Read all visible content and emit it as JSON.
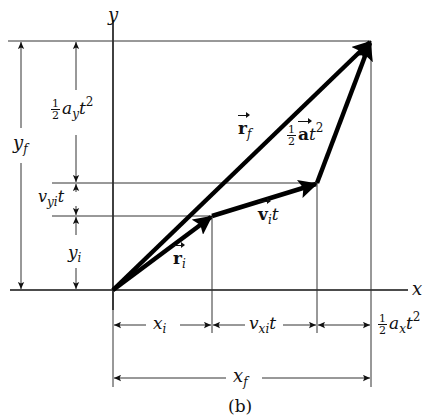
{
  "figure": {
    "caption": "(b)",
    "axes": {
      "x_label": "x",
      "y_label": "y"
    },
    "vectors": {
      "r_i": {
        "symbol": "r",
        "subscript": "i"
      },
      "v_i_t": {
        "symbol": "v",
        "subscript": "i",
        "suffix": "t"
      },
      "r_f": {
        "symbol": "r",
        "subscript": "f"
      },
      "half_a_t2": {
        "num": "1",
        "den": "2",
        "symbol": "a",
        "suffix": "t",
        "exp": "2"
      }
    },
    "y_dimensions": {
      "y_f": {
        "base": "y",
        "subscript": "f"
      },
      "half_ay_t2": {
        "num": "1",
        "den": "2",
        "base": "a",
        "subscript": "y",
        "suffix": "t",
        "exp": "2"
      },
      "vyi_t": {
        "base": "v",
        "subscript": "yi",
        "suffix": "t"
      },
      "y_i": {
        "base": "y",
        "subscript": "i"
      }
    },
    "x_dimensions": {
      "x_i": {
        "base": "x",
        "subscript": "i"
      },
      "vxi_t": {
        "base": "v",
        "subscript": "xi",
        "suffix": "t"
      },
      "half_ax_t2": {
        "num": "1",
        "den": "2",
        "base": "a",
        "subscript": "x",
        "suffix": "t",
        "exp": "2"
      },
      "x_f": {
        "base": "x",
        "subscript": "f"
      }
    },
    "points": {
      "origin": [
        113,
        290
      ],
      "r_i_tip": [
        212,
        216
      ],
      "v_i_t_tip": [
        317,
        183
      ],
      "r_f_tip": [
        371,
        41
      ]
    }
  }
}
